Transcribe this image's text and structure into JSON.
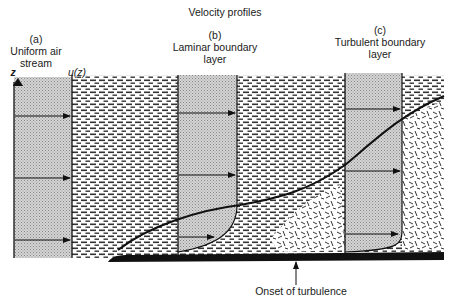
{
  "title": "Velocity profiles",
  "panels": [
    {
      "letter": "(a)",
      "line1": "Uniform air",
      "line2": "stream"
    },
    {
      "letter": "(b)",
      "line1": "Laminar boundary",
      "line2": "layer"
    },
    {
      "letter": "(c)",
      "line1": "Turbulent boundary",
      "line2": "layer"
    }
  ],
  "axes": {
    "z_label": "z",
    "u_label": "u(z)"
  },
  "annotation": "Onset of turbulence",
  "colors": {
    "ink": "#111111",
    "stipple": "#c8c8c8",
    "background": "#ffffff"
  }
}
